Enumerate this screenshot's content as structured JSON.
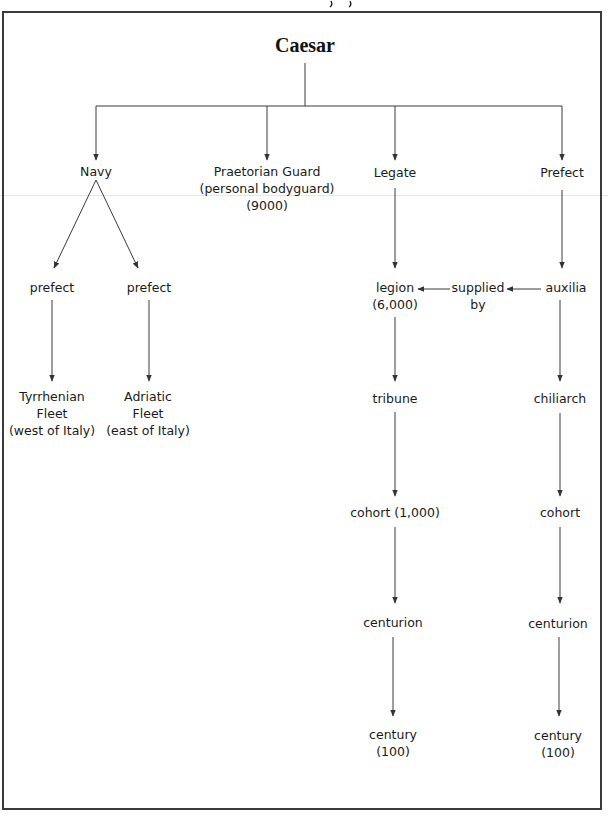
{
  "diagram": {
    "root": {
      "id": "caesar",
      "label": "Caesar"
    },
    "level1": [
      {
        "id": "navy",
        "lines": [
          "Navy"
        ]
      },
      {
        "id": "praetorian-guard",
        "lines": [
          "Praetorian Guard",
          "(personal bodyguard)",
          "(9000)"
        ]
      },
      {
        "id": "legate",
        "lines": [
          "Legate"
        ]
      },
      {
        "id": "prefect",
        "lines": [
          "Prefect"
        ]
      }
    ],
    "navy_branch": [
      {
        "id": "prefect-left",
        "lines": [
          "prefect"
        ],
        "child": {
          "id": "tyrrhenian-fleet",
          "lines": [
            "Tyrrhenian",
            "Fleet",
            "(west of Italy)"
          ]
        }
      },
      {
        "id": "prefect-right",
        "lines": [
          "prefect"
        ],
        "child": {
          "id": "adriatic-fleet",
          "lines": [
            "Adriatic",
            "Fleet",
            "(east of Italy)"
          ]
        }
      }
    ],
    "legate_chain": [
      {
        "id": "legion",
        "lines": [
          "legion",
          "(6,000)"
        ]
      },
      {
        "id": "tribune",
        "lines": [
          "tribune"
        ]
      },
      {
        "id": "cohort-legion",
        "lines": [
          "cohort (1,000)"
        ]
      },
      {
        "id": "centurion-legion",
        "lines": [
          "centurion"
        ]
      },
      {
        "id": "century-legion",
        "lines": [
          "century",
          "(100)"
        ]
      }
    ],
    "prefect_chain": [
      {
        "id": "auxilia",
        "lines": [
          "auxilia"
        ]
      },
      {
        "id": "chiliarch",
        "lines": [
          "chiliarch"
        ]
      },
      {
        "id": "cohort-auxilia",
        "lines": [
          "cohort"
        ]
      },
      {
        "id": "centurion-auxilia",
        "lines": [
          "centurion"
        ]
      },
      {
        "id": "century-auxilia",
        "lines": [
          "century",
          "(100)"
        ]
      }
    ],
    "supplied_by": {
      "lines": [
        "supplied",
        "by"
      ]
    },
    "edges": [
      [
        "caesar",
        "navy"
      ],
      [
        "caesar",
        "praetorian-guard"
      ],
      [
        "caesar",
        "legate"
      ],
      [
        "caesar",
        "prefect"
      ],
      [
        "navy",
        "prefect-left"
      ],
      [
        "navy",
        "prefect-right"
      ],
      [
        "prefect-left",
        "tyrrhenian-fleet"
      ],
      [
        "prefect-right",
        "adriatic-fleet"
      ],
      [
        "legate",
        "legion"
      ],
      [
        "legion",
        "tribune"
      ],
      [
        "tribune",
        "cohort-legion"
      ],
      [
        "cohort-legion",
        "centurion-legion"
      ],
      [
        "centurion-legion",
        "century-legion"
      ],
      [
        "prefect",
        "auxilia"
      ],
      [
        "auxilia",
        "chiliarch"
      ],
      [
        "chiliarch",
        "cohort-auxilia"
      ],
      [
        "cohort-auxilia",
        "centurion-auxilia"
      ],
      [
        "centurion-auxilia",
        "century-auxilia"
      ],
      [
        "auxilia",
        "supplied-by"
      ],
      [
        "supplied-by",
        "legion"
      ]
    ]
  },
  "colors": {
    "line": "#3a3a3a",
    "text": "#1a1a1a",
    "border": "#3a3a3a"
  }
}
